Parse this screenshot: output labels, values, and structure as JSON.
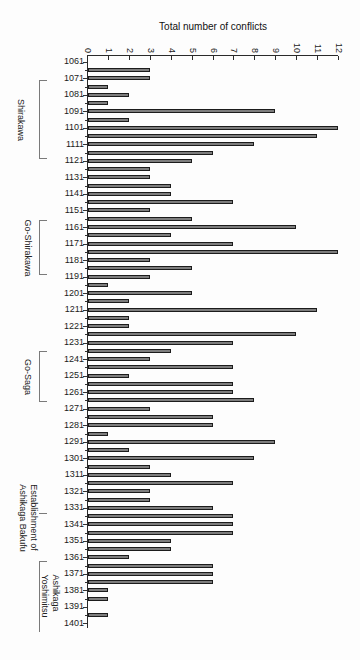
{
  "chart_data": {
    "type": "bar",
    "orientation": "horizontal",
    "title": "Total number of conflicts",
    "xlabel": "Total number of conflicts",
    "ylabel": "",
    "xlim": [
      0,
      12
    ],
    "x_tick_labels": [
      "0",
      "1",
      "2",
      "3",
      "4",
      "5",
      "6",
      "7",
      "8",
      "9",
      "10",
      "11",
      "12"
    ],
    "grid": false,
    "legend": "none",
    "bin_years": 5,
    "rows": [
      {
        "label": "1061",
        "value": 0
      },
      {
        "label": "",
        "value": 3
      },
      {
        "label": "1071",
        "value": 3
      },
      {
        "label": "",
        "value": 1
      },
      {
        "label": "1081",
        "value": 2
      },
      {
        "label": "",
        "value": 1
      },
      {
        "label": "1091",
        "value": 9
      },
      {
        "label": "",
        "value": 2
      },
      {
        "label": "1101",
        "value": 12
      },
      {
        "label": "",
        "value": 11
      },
      {
        "label": "1111",
        "value": 8
      },
      {
        "label": "",
        "value": 6
      },
      {
        "label": "1121",
        "value": 5
      },
      {
        "label": "",
        "value": 3
      },
      {
        "label": "1131",
        "value": 3
      },
      {
        "label": "",
        "value": 4
      },
      {
        "label": "1141",
        "value": 4
      },
      {
        "label": "",
        "value": 7
      },
      {
        "label": "1151",
        "value": 3
      },
      {
        "label": "",
        "value": 5
      },
      {
        "label": "1161",
        "value": 10
      },
      {
        "label": "",
        "value": 4
      },
      {
        "label": "1171",
        "value": 7
      },
      {
        "label": "",
        "value": 12
      },
      {
        "label": "1181",
        "value": 3
      },
      {
        "label": "",
        "value": 5
      },
      {
        "label": "1191",
        "value": 3
      },
      {
        "label": "",
        "value": 1
      },
      {
        "label": "1201",
        "value": 5
      },
      {
        "label": "",
        "value": 2
      },
      {
        "label": "1211",
        "value": 11
      },
      {
        "label": "",
        "value": 2
      },
      {
        "label": "1221",
        "value": 2
      },
      {
        "label": "",
        "value": 10
      },
      {
        "label": "1231",
        "value": 7
      },
      {
        "label": "",
        "value": 4
      },
      {
        "label": "1241",
        "value": 3
      },
      {
        "label": "",
        "value": 7
      },
      {
        "label": "1251",
        "value": 2
      },
      {
        "label": "",
        "value": 7
      },
      {
        "label": "1261",
        "value": 7
      },
      {
        "label": "",
        "value": 8
      },
      {
        "label": "1271",
        "value": 3
      },
      {
        "label": "",
        "value": 6
      },
      {
        "label": "1281",
        "value": 6
      },
      {
        "label": "",
        "value": 1
      },
      {
        "label": "1291",
        "value": 9
      },
      {
        "label": "",
        "value": 2
      },
      {
        "label": "1301",
        "value": 8
      },
      {
        "label": "",
        "value": 3
      },
      {
        "label": "1311",
        "value": 4
      },
      {
        "label": "",
        "value": 7
      },
      {
        "label": "1321",
        "value": 3
      },
      {
        "label": "",
        "value": 3
      },
      {
        "label": "1331",
        "value": 6
      },
      {
        "label": "",
        "value": 7
      },
      {
        "label": "1341",
        "value": 7
      },
      {
        "label": "",
        "value": 7
      },
      {
        "label": "1351",
        "value": 4
      },
      {
        "label": "",
        "value": 4
      },
      {
        "label": "1361",
        "value": 2
      },
      {
        "label": "",
        "value": 6
      },
      {
        "label": "1371",
        "value": 6
      },
      {
        "label": "",
        "value": 6
      },
      {
        "label": "1381",
        "value": 1
      },
      {
        "label": "",
        "value": 1
      },
      {
        "label": "1391",
        "value": 0
      },
      {
        "label": "",
        "value": 1
      },
      {
        "label": "1401",
        "value": 0
      }
    ],
    "periods": [
      {
        "name": "Shirakawa",
        "lines": [
          "Shirakawa"
        ],
        "from_year": 1072,
        "to_year": 1120,
        "style": "bracket"
      },
      {
        "name": "Go-Shirakawa",
        "lines": [
          "Go-Shirakawa"
        ],
        "from_year": 1157,
        "to_year": 1190,
        "style": "bracket"
      },
      {
        "name": "Go-Saga",
        "lines": [
          "Go-Saga"
        ],
        "from_year": 1236,
        "to_year": 1267,
        "style": "bracket"
      },
      {
        "name": "Establishment of Ashikaga Bakufu",
        "lines": [
          "Establishment of",
          "Ashikaga Bakufu"
        ],
        "from_year": 1334,
        "to_year": 1334,
        "style": "tick"
      },
      {
        "name": "Ashikaga Yoshimitsu",
        "lines": [
          "Ashikaga",
          "Yoshimitsu"
        ],
        "from_year": 1363,
        "to_year": 1406,
        "style": "bracket-open"
      }
    ],
    "colors": {
      "bar_fill": "#7d7d7d",
      "bar_border": "#1c1c1c",
      "axis": "#2a2a2a",
      "bracket": "#7a7a7a",
      "text": "#1b1b1b"
    }
  }
}
